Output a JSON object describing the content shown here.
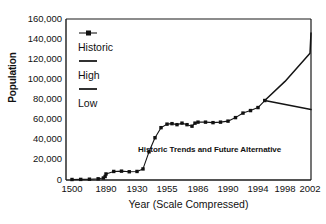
{
  "chart_data": {
    "type": "line",
    "title": "",
    "xlabel": "Year (Scale Compressed)",
    "ylabel": "Population",
    "xtick_labels": [
      "1500",
      "1890",
      "1930",
      "1955",
      "1986",
      "1990",
      "1994",
      "1998",
      "2002"
    ],
    "ytick_labels": [
      "0",
      "20,000",
      "40,000",
      "60,000",
      "80,000",
      "100,000",
      "120,000",
      "140,000",
      "160,000"
    ],
    "ylim": [
      0,
      160000
    ],
    "ytick_values": [
      0,
      20000,
      40000,
      60000,
      80000,
      100000,
      120000,
      140000,
      160000
    ],
    "grid": false,
    "legend_position": "inside-upper-left",
    "annotation": "Historic Trends and Future Alternative",
    "series": [
      {
        "name": "Historic",
        "marker": "square",
        "points": [
          {
            "x": 1500,
            "y": 500
          },
          {
            "x": 1600,
            "y": 600
          },
          {
            "x": 1700,
            "y": 800
          },
          {
            "x": 1800,
            "y": 1200
          },
          {
            "x": 1860,
            "y": 2000
          },
          {
            "x": 1880,
            "y": 3500
          },
          {
            "x": 1890,
            "y": 6000
          },
          {
            "x": 1900,
            "y": 8500
          },
          {
            "x": 1910,
            "y": 8800
          },
          {
            "x": 1920,
            "y": 8200
          },
          {
            "x": 1930,
            "y": 8500
          },
          {
            "x": 1935,
            "y": 11000
          },
          {
            "x": 1940,
            "y": 28000
          },
          {
            "x": 1945,
            "y": 42000
          },
          {
            "x": 1950,
            "y": 52000
          },
          {
            "x": 1955,
            "y": 55500
          },
          {
            "x": 1960,
            "y": 56000
          },
          {
            "x": 1965,
            "y": 55000
          },
          {
            "x": 1970,
            "y": 56500
          },
          {
            "x": 1975,
            "y": 55000
          },
          {
            "x": 1980,
            "y": 53500
          },
          {
            "x": 1983,
            "y": 56500
          },
          {
            "x": 1986,
            "y": 57500
          },
          {
            "x": 1987,
            "y": 57500
          },
          {
            "x": 1988,
            "y": 57000
          },
          {
            "x": 1989,
            "y": 57500
          },
          {
            "x": 1990,
            "y": 58500
          },
          {
            "x": 1991,
            "y": 62000
          },
          {
            "x": 1992,
            "y": 66500
          },
          {
            "x": 1993,
            "y": 69000
          },
          {
            "x": 1994,
            "y": 72000
          },
          {
            "x": 1995,
            "y": 79000
          }
        ]
      },
      {
        "name": "High",
        "marker": "none",
        "points": [
          {
            "x": 1995,
            "y": 79000
          },
          {
            "x": 1998,
            "y": 98000
          },
          {
            "x": 2002,
            "y": 126000
          },
          {
            "x": 2005,
            "y": 146000
          }
        ]
      },
      {
        "name": "Low",
        "marker": "none",
        "points": [
          {
            "x": 1995,
            "y": 79000
          },
          {
            "x": 2005,
            "y": 70000
          }
        ]
      }
    ]
  },
  "legend": {
    "items": [
      {
        "label": "Historic",
        "style": "line-with-marker"
      },
      {
        "label": "High",
        "style": "line"
      },
      {
        "label": "Low",
        "style": "line"
      }
    ]
  }
}
